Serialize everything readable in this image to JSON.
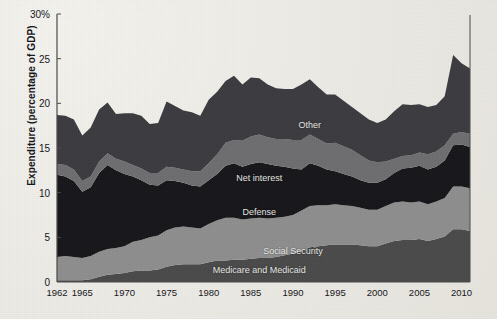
{
  "chart_data": {
    "type": "area",
    "stacked": true,
    "title": "",
    "xlabel": "",
    "ylabel": "Expenditure (percentage of GDP)",
    "ylim": [
      0,
      30
    ],
    "xlim": [
      1962,
      2011
    ],
    "ytick_values": [
      0,
      5,
      10,
      15,
      20,
      25,
      30
    ],
    "ytick_labels": [
      "0",
      "5",
      "10",
      "15",
      "20",
      "25",
      "30%"
    ],
    "xtick_values": [
      1962,
      1965,
      1970,
      1975,
      1980,
      1985,
      1990,
      1995,
      2000,
      2005,
      2010
    ],
    "xtick_labels": [
      "1962",
      "1965",
      "1970",
      "1975",
      "1980",
      "1985",
      "1990",
      "1995",
      "2000",
      "2005",
      "2010"
    ],
    "grid": false,
    "legend_position": "inline-annotations",
    "background_color": "#edece6",
    "axis_color": "#4a4a4a",
    "x": [
      1962,
      1963,
      1964,
      1965,
      1966,
      1967,
      1968,
      1969,
      1970,
      1971,
      1972,
      1973,
      1974,
      1975,
      1976,
      1977,
      1978,
      1979,
      1980,
      1981,
      1982,
      1983,
      1984,
      1985,
      1986,
      1987,
      1988,
      1989,
      1990,
      1991,
      1992,
      1993,
      1994,
      1995,
      1996,
      1997,
      1998,
      1999,
      2000,
      2001,
      2002,
      2003,
      2004,
      2005,
      2006,
      2007,
      2008,
      2009,
      2010,
      2011
    ],
    "series": [
      {
        "name": "Medicare and Medicaid",
        "color": "#4a4a4a",
        "label_x": 1986,
        "label_y": 1.3,
        "values": [
          0.2,
          0.2,
          0.2,
          0.2,
          0.3,
          0.6,
          0.8,
          0.9,
          1.0,
          1.2,
          1.3,
          1.3,
          1.4,
          1.7,
          1.9,
          2.0,
          2.0,
          2.0,
          2.2,
          2.4,
          2.4,
          2.5,
          2.5,
          2.6,
          2.7,
          2.7,
          2.8,
          3.0,
          3.2,
          3.5,
          3.9,
          4.0,
          4.1,
          4.2,
          4.2,
          4.2,
          4.1,
          4.0,
          4.0,
          4.3,
          4.6,
          4.7,
          4.7,
          4.8,
          4.6,
          4.8,
          5.1,
          5.9,
          5.9,
          5.7
        ]
      },
      {
        "name": "Social Security",
        "color": "#8e8e8e",
        "label_x": 1990,
        "label_y": 3.5,
        "values": [
          2.6,
          2.7,
          2.6,
          2.5,
          2.6,
          2.8,
          2.9,
          2.9,
          3.0,
          3.3,
          3.4,
          3.7,
          3.8,
          4.1,
          4.2,
          4.2,
          4.1,
          4.0,
          4.3,
          4.5,
          4.8,
          4.7,
          4.5,
          4.5,
          4.5,
          4.4,
          4.4,
          4.3,
          4.3,
          4.5,
          4.6,
          4.6,
          4.5,
          4.5,
          4.4,
          4.3,
          4.2,
          4.1,
          4.1,
          4.2,
          4.3,
          4.3,
          4.2,
          4.2,
          4.1,
          4.2,
          4.3,
          4.8,
          4.8,
          4.8
        ]
      },
      {
        "name": "Defense",
        "color": "#17171b",
        "label_x": 1986,
        "label_y": 7.8,
        "values": [
          9.2,
          8.9,
          8.5,
          7.4,
          7.7,
          8.8,
          9.4,
          8.7,
          8.1,
          7.3,
          6.7,
          5.9,
          5.6,
          5.6,
          5.2,
          4.9,
          4.7,
          4.7,
          4.9,
          5.2,
          5.8,
          6.1,
          5.9,
          6.1,
          6.2,
          6.1,
          5.8,
          5.6,
          5.2,
          4.6,
          4.8,
          4.4,
          4.0,
          3.7,
          3.5,
          3.3,
          3.1,
          3.0,
          3.0,
          3.0,
          3.3,
          3.7,
          3.9,
          4.0,
          3.9,
          3.9,
          4.2,
          4.6,
          4.7,
          4.6
        ]
      },
      {
        "name": "Net interest",
        "color": "#6e6e70",
        "label_x": 1986,
        "label_y": 11.6,
        "values": [
          1.2,
          1.3,
          1.3,
          1.2,
          1.2,
          1.3,
          1.3,
          1.3,
          1.4,
          1.3,
          1.3,
          1.3,
          1.4,
          1.5,
          1.5,
          1.5,
          1.6,
          1.7,
          1.9,
          2.2,
          2.6,
          2.6,
          2.9,
          3.1,
          3.1,
          3.0,
          3.0,
          3.1,
          3.2,
          3.3,
          3.2,
          3.0,
          2.9,
          3.2,
          3.1,
          3.0,
          2.8,
          2.5,
          2.3,
          2.0,
          1.6,
          1.4,
          1.4,
          1.5,
          1.7,
          1.7,
          1.7,
          1.3,
          1.4,
          1.5
        ]
      },
      {
        "name": "Other",
        "color": "#3c3c40",
        "label_x": 1992,
        "label_y": 17.6,
        "values": [
          5.5,
          5.5,
          5.6,
          5.1,
          5.5,
          5.8,
          5.7,
          5.0,
          5.4,
          5.8,
          5.9,
          5.5,
          5.6,
          7.3,
          6.9,
          6.6,
          6.6,
          6.2,
          7.1,
          7.0,
          6.9,
          7.2,
          6.3,
          6.6,
          6.3,
          5.9,
          5.7,
          5.6,
          5.7,
          6.2,
          6.2,
          5.8,
          5.5,
          5.4,
          5.1,
          4.8,
          4.7,
          4.6,
          4.4,
          4.7,
          5.3,
          5.8,
          5.6,
          5.4,
          5.3,
          5.2,
          5.5,
          8.8,
          7.7,
          7.3
        ]
      }
    ],
    "totals_note": "Top of stack = total federal outlays as % of GDP"
  },
  "axis": {
    "y_title": "Expenditure (percentage of GDP)"
  }
}
